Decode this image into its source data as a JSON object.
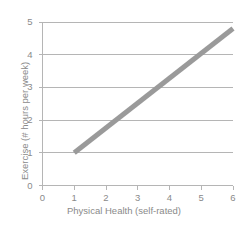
{
  "chart_data": {
    "type": "line",
    "title": "",
    "xlabel": "Physical Health (self-rated)",
    "ylabel": "Exercise (# hours per week)",
    "xlim": [
      0,
      6
    ],
    "ylim": [
      0,
      5
    ],
    "xticks": [
      "0",
      "1",
      "2",
      "3",
      "4",
      "5",
      "6"
    ],
    "yticks": [
      "0",
      "1",
      "2",
      "3",
      "4",
      "5"
    ],
    "grid": "horizontal",
    "gridlines_y": [
      1,
      2,
      3,
      4,
      5
    ],
    "legend": "none",
    "series": [
      {
        "name": "trend-line",
        "color": "#9a9a9a",
        "line_width": 5,
        "x": [
          1,
          6
        ],
        "values": [
          1,
          4.8
        ]
      }
    ]
  },
  "style": {
    "background": "#ffffff",
    "axis_color": "#b5b5b5",
    "grid_color": "#b5b5b5",
    "tick_color": "#b5b5b5",
    "text_color": "#8a8a8a",
    "line_color": "#9a9a9a"
  }
}
